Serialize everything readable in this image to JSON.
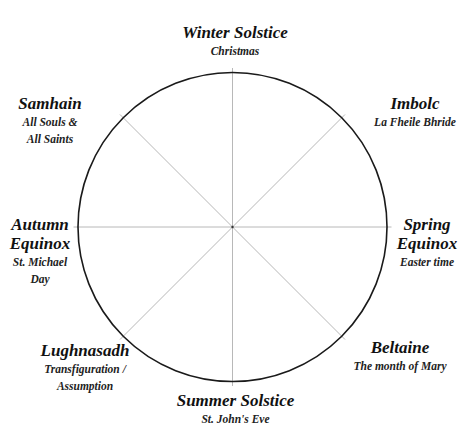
{
  "diagram": {
    "colors": {
      "circle": "#1a1a1a",
      "spokes": "#b8b8b8",
      "text": "#111111"
    },
    "center": {
      "x": 232.5,
      "y": 227
    },
    "radius": 159,
    "festivals": [
      {
        "id": "winter-solstice",
        "name": "Winter Solstice",
        "christian": "Christmas"
      },
      {
        "id": "imbolc",
        "name": "Imbolc",
        "christian": "La Fheile Bhride"
      },
      {
        "id": "spring-equinox",
        "name_line1": "Spring",
        "name_line2": "Equinox",
        "christian": "Easter time"
      },
      {
        "id": "beltaine",
        "name": "Beltaine",
        "christian": "The month of Mary"
      },
      {
        "id": "summer-solstice",
        "name": "Summer Solstice",
        "christian": "St. John's Eve"
      },
      {
        "id": "lughnasadh",
        "name": "Lughnasadh",
        "christian_line1": "Transfiguration /",
        "christian_line2": "Assumption"
      },
      {
        "id": "autumn-equinox",
        "name_line1": "Autumn",
        "name_line2": "Equinox",
        "christian_line1": "St. Michael",
        "christian_line2": "Day"
      },
      {
        "id": "samhain",
        "name": "Samhain",
        "christian_line1": "All Souls &",
        "christian_line2": "All Saints"
      }
    ]
  }
}
